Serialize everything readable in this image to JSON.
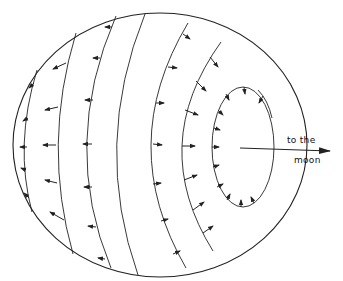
{
  "figure": {
    "type": "tidal-force-diagram",
    "colors": {
      "line": "#222222",
      "background": "#ffffff"
    }
  },
  "label": {
    "line1": "to the",
    "line2": "moon"
  },
  "elements": {
    "outer_circle": {
      "cx": 160,
      "cy": 145,
      "rx": 147,
      "ry": 132
    },
    "arcs": [
      {
        "name": "arc-1",
        "arrow_direction": "left"
      },
      {
        "name": "arc-2",
        "arrow_direction": "left"
      },
      {
        "name": "arc-3",
        "arrow_direction": "left"
      },
      {
        "name": "arc-4",
        "arrow_direction": "none"
      },
      {
        "name": "arc-5",
        "arrow_direction": "right"
      },
      {
        "name": "arc-6",
        "arrow_direction": "right"
      },
      {
        "name": "inner-ellipse",
        "arrow_direction": "inward"
      }
    ],
    "moon_arrow": {
      "x1": 240,
      "y1": 148,
      "x2": 330,
      "y2": 151
    }
  }
}
